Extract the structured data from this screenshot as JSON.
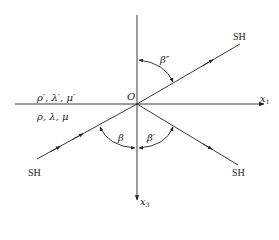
{
  "diagram": {
    "type": "wave-reflection-refraction",
    "origin_label": "O",
    "axes": {
      "x1": {
        "label": "x",
        "subscript": "1"
      },
      "x3": {
        "label": "x",
        "subscript": "3"
      }
    },
    "media": {
      "upper": "ρ′, λ′, μ′",
      "lower": "ρ, λ, μ"
    },
    "rays": [
      {
        "id": "incident",
        "label": "SH"
      },
      {
        "id": "reflected",
        "label": "SH"
      },
      {
        "id": "refracted",
        "label": "SH"
      }
    ],
    "angles": {
      "incident": "β",
      "reflected": "β′",
      "refracted": "β″"
    },
    "colors": {
      "line": "#222222",
      "background": "#ffffff"
    }
  }
}
